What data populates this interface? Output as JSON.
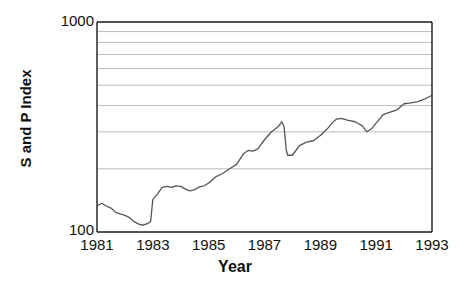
{
  "chart_data": {
    "type": "line",
    "title": "",
    "xlabel": "Year",
    "ylabel": "S and P Index",
    "yscale": "log",
    "ylim": [
      100,
      1000
    ],
    "xlim": [
      1981,
      1993
    ],
    "grid": true,
    "grid_axis": "y",
    "legend": "none",
    "y_tick_labels": [
      "1000",
      "100"
    ],
    "y_gridline_values": [
      900,
      800,
      700,
      600,
      500,
      400,
      300,
      200
    ],
    "x_tick_labels": [
      "1981",
      "1983",
      "1985",
      "1987",
      "1989",
      "1991",
      "1993"
    ],
    "x_tick_values": [
      1981,
      1983,
      1985,
      1987,
      1989,
      1991,
      1993
    ],
    "series": [
      {
        "name": "S and P Index",
        "color": "#555555",
        "x": [
          1981.0,
          1981.17,
          1981.33,
          1981.5,
          1981.67,
          1981.83,
          1982.0,
          1982.17,
          1982.33,
          1982.5,
          1982.58,
          1982.67,
          1982.75,
          1982.83,
          1982.92,
          1983.0,
          1983.17,
          1983.33,
          1983.5,
          1983.67,
          1983.83,
          1984.0,
          1984.17,
          1984.33,
          1984.5,
          1984.67,
          1984.83,
          1985.0,
          1985.25,
          1985.5,
          1985.75,
          1986.0,
          1986.25,
          1986.42,
          1986.58,
          1986.75,
          1987.0,
          1987.25,
          1987.5,
          1987.62,
          1987.7,
          1987.78,
          1987.83,
          1988.0,
          1988.25,
          1988.5,
          1988.75,
          1989.0,
          1989.25,
          1989.42,
          1989.58,
          1989.75,
          1990.0,
          1990.25,
          1990.5,
          1990.67,
          1990.83,
          1991.0,
          1991.25,
          1991.5,
          1991.75,
          1992.0,
          1992.25,
          1992.5,
          1992.75,
          1993.0
        ],
        "y": [
          133,
          137,
          133,
          130,
          124,
          122,
          120,
          117,
          112,
          109,
          108,
          108,
          109,
          110,
          112,
          143,
          152,
          163,
          165,
          163,
          166,
          165,
          160,
          157,
          159,
          164,
          166,
          171,
          183,
          190,
          200,
          210,
          236,
          245,
          243,
          248,
          275,
          300,
          318,
          335,
          318,
          245,
          232,
          232,
          258,
          268,
          272,
          288,
          310,
          330,
          345,
          348,
          340,
          335,
          320,
          300,
          310,
          330,
          362,
          372,
          382,
          408,
          412,
          418,
          430,
          448
        ]
      }
    ]
  },
  "axes": {
    "y_top_label": "1000",
    "y_bottom_label": "100",
    "y_title": "S and P Index",
    "x_title": "Year",
    "x_labels": [
      "1981",
      "1983",
      "1985",
      "1987",
      "1989",
      "1991",
      "1993"
    ]
  },
  "colors": {
    "line": "#555555",
    "grid": "#bbbbbb",
    "frame": "#1a1a1a",
    "text": "#111111",
    "background": "#ffffff"
  }
}
